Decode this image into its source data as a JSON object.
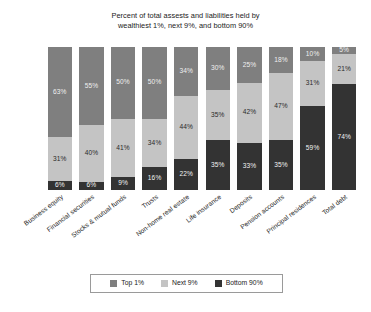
{
  "chart_data": {
    "type": "bar",
    "subtype": "stacked-percent",
    "title": "Percent of total assests and liabilities held by wealthiest 1%, next 9%, and bottom 90%",
    "title_lines": [
      "Percent of total assests and liabilities held by",
      "wealthiest 1%, next 9%, and bottom 90%"
    ],
    "xlabel": "",
    "ylabel": "",
    "ylim": [
      0,
      100
    ],
    "grid": false,
    "legend_position": "bottom",
    "categories": [
      "Business equity",
      "Financial securities",
      "Stocks & mutual funds",
      "Trusts",
      "Non-home real estate",
      "Life insurance",
      "Deposits",
      "Pension accounts",
      "Principal residences",
      "Total debt"
    ],
    "series": [
      {
        "name": "Top 1%",
        "color": "#7f7f7f",
        "values": [
          63,
          55,
          50,
          50,
          34,
          30,
          25,
          18,
          10,
          5
        ],
        "labels": [
          "63%",
          "55%",
          "50%",
          "50%",
          "34%",
          "30%",
          "25%",
          "18%",
          "10%",
          "5%"
        ]
      },
      {
        "name": "Next 9%",
        "color": "#c4c4c4",
        "values": [
          31,
          40,
          41,
          34,
          44,
          35,
          42,
          47,
          31,
          21
        ],
        "labels": [
          "31%",
          "40%",
          "41%",
          "34%",
          "44%",
          "35%",
          "42%",
          "47%",
          "31%",
          "21%"
        ]
      },
      {
        "name": "Bottom 90%",
        "color": "#333333",
        "values": [
          6,
          6,
          9,
          16,
          22,
          35,
          33,
          35,
          59,
          74
        ],
        "labels": [
          "6%",
          "6%",
          "9%",
          "16%",
          "22%",
          "35%",
          "33%",
          "35%",
          "59%",
          "74%"
        ]
      }
    ]
  },
  "legend": {
    "entries": [
      {
        "label": "Top 1%",
        "color": "#7f7f7f"
      },
      {
        "label": "Next 9%",
        "color": "#c4c4c4"
      },
      {
        "label": "Bottom 90%",
        "color": "#333333"
      }
    ]
  }
}
